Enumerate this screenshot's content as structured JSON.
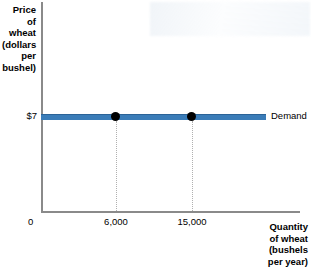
{
  "chart_data": {
    "type": "line",
    "title": "",
    "xlabel": "Quantity of wheat (bushels per year)",
    "ylabel": "Price of wheat (dollars per bushel)",
    "xlabel_lines": [
      "Quantity",
      "of wheat",
      "(bushels",
      "per year)"
    ],
    "ylabel_lines": [
      "Price of",
      "wheat",
      "(dollars",
      "per",
      "bushel)"
    ],
    "origin_label": "0",
    "y_tick_labels": [
      "$7"
    ],
    "y_values": [
      7
    ],
    "x_tick_labels": [
      "6,000",
      "15,000"
    ],
    "x_values": [
      6000,
      15000
    ],
    "series": [
      {
        "name": "Demand",
        "label": "Demand",
        "color": "#3a7cb8",
        "x": [
          0,
          6000,
          15000,
          21000
        ],
        "y": [
          7,
          7,
          7,
          7
        ],
        "points": [
          {
            "x": 6000,
            "y": 7,
            "label": "6,000"
          },
          {
            "x": 15000,
            "y": 7,
            "label": "15,000"
          }
        ]
      }
    ],
    "grid": false,
    "dropline_style": "dotted",
    "legend_position": "right-inline",
    "axis_color": "#8a8a8a",
    "point_color": "#000000"
  }
}
